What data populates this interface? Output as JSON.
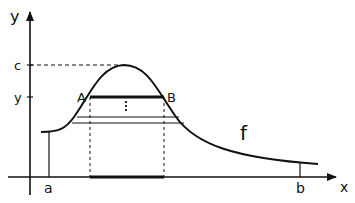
{
  "diagram": {
    "type": "function-graph",
    "axes": {
      "x_label": "x",
      "y_label": "y"
    },
    "y_ticks": [
      {
        "label": "c"
      },
      {
        "label": "y"
      }
    ],
    "x_ticks": [
      {
        "label": "a"
      },
      {
        "label": "b"
      }
    ],
    "points": [
      {
        "label": "A"
      },
      {
        "label": "B"
      }
    ],
    "function_label": "f",
    "colors": {
      "stroke": "#111111",
      "background": "#ffffff"
    }
  }
}
